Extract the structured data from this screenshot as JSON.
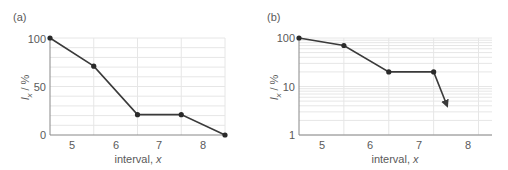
{
  "chart_data": [
    {
      "panel_label": "(a)",
      "type": "line",
      "title": "",
      "xlabel": "interval, x",
      "ylabel": "lx / %",
      "x": [
        4.5,
        5.5,
        6.5,
        7.5,
        8.5
      ],
      "values": [
        100,
        71,
        21,
        21,
        0
      ],
      "xlim": [
        4.5,
        8.5
      ],
      "ylim": [
        0,
        100
      ],
      "yscale": "linear",
      "xticks": [
        "5",
        "6",
        "7",
        "8"
      ],
      "yticks": [
        "0",
        "50",
        "100"
      ],
      "grid": true,
      "line_color": "#3a3a3a",
      "grid_color": "#e6e6e6"
    },
    {
      "panel_label": "(b)",
      "type": "line",
      "title": "",
      "xlabel": "interval, x",
      "ylabel": "lx / %",
      "x": [
        4.5,
        5.5,
        6.5,
        7.5
      ],
      "values": [
        100,
        70,
        20,
        20
      ],
      "arrow_to": {
        "x": 7.8,
        "y": 4
      },
      "xlim": [
        4.5,
        8.8
      ],
      "ylim": [
        1,
        100
      ],
      "yscale": "log",
      "xticks": [
        "5",
        "6",
        "7",
        "8"
      ],
      "yticks": [
        "1",
        "10",
        "100"
      ],
      "grid": true,
      "line_color": "#3a3a3a",
      "grid_color": "#e6e6e6"
    }
  ],
  "panels": {
    "a": {
      "label": "(a)",
      "xlabel_text": "interval, ",
      "xlabel_var": "x",
      "ylabel_var": "l",
      "ylabel_sub": "x",
      "ylabel_unit": " / %",
      "yticks": [
        "100",
        "50",
        "0"
      ],
      "xticks": [
        "5",
        "6",
        "7",
        "8"
      ]
    },
    "b": {
      "label": "(b)",
      "xlabel_text": "interval, ",
      "xlabel_var": "x",
      "ylabel_var": "l",
      "ylabel_sub": "x",
      "ylabel_unit": " / %",
      "yticks": [
        "100",
        "10",
        "1"
      ],
      "xticks": [
        "5",
        "6",
        "7",
        "8"
      ]
    }
  }
}
